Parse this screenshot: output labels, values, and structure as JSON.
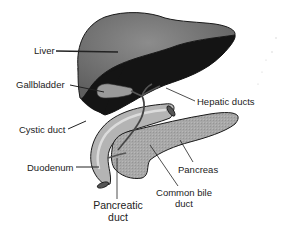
{
  "diagram": {
    "title": "",
    "colors": {
      "liver_top": "#6e6e6e",
      "liver_highlight": "#8a8a8a",
      "liver_underside": "#141414",
      "gallbladder": "#9a9a9a",
      "duodenum": "#b4b4b4",
      "duodenum_highlight": "#d6d6d6",
      "pancreas": "#a6a6a6",
      "duct": "#6a6a6a",
      "outline": "#1a1a1a",
      "leader_line": "#222222"
    },
    "labels": [
      {
        "id": "liver",
        "text": "Liver"
      },
      {
        "id": "gallbladder",
        "text": "Gallbladder"
      },
      {
        "id": "hepatic-ducts",
        "text": "Hepatic ducts"
      },
      {
        "id": "cystic-duct",
        "text": "Cystic duct"
      },
      {
        "id": "duodenum",
        "text": "Duodenum"
      },
      {
        "id": "pancreas",
        "text": "Pancreas"
      },
      {
        "id": "common-bile-duct",
        "text": "Common bile duct",
        "lines": [
          "Common bile",
          "duct"
        ]
      },
      {
        "id": "pancreatic-duct",
        "text": "Pancreatic duct",
        "lines": [
          "Pancreatic",
          "duct"
        ]
      }
    ]
  }
}
